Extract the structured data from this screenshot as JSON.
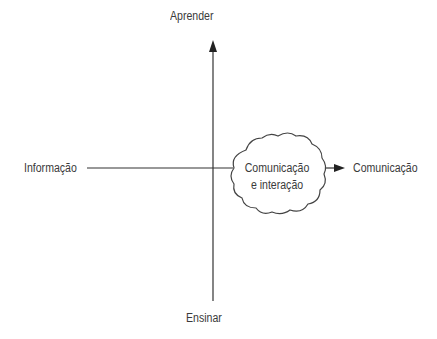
{
  "diagram": {
    "axes": {
      "top": "Aprender",
      "bottom": "Ensinar",
      "left": "Informação",
      "right": "Comunicação"
    },
    "center_node": {
      "line1": "Comunicação",
      "line2": "e interação",
      "shape": "cloud"
    },
    "colors": {
      "line": "#333333",
      "text": "#3a3a3a",
      "background": "#ffffff"
    }
  }
}
